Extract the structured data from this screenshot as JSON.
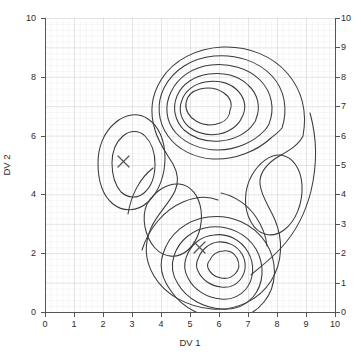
{
  "chart_data": {
    "type": "contour",
    "title": "",
    "xlabel": "DV 1",
    "ylabel": "DV 2",
    "xlim": [
      0,
      10
    ],
    "ylim": [
      0,
      10
    ],
    "grid": true,
    "grid_minor_step": 0.2,
    "grid_major_step": 1,
    "x_ticks": [
      0,
      1,
      2,
      3,
      4,
      5,
      6,
      7,
      8,
      9,
      10
    ],
    "x_tick_labels": [
      "0",
      "1",
      "2",
      "3",
      "4",
      "5",
      "6",
      "7",
      "8",
      "9",
      "10"
    ],
    "y_ticks_left": [
      0,
      2,
      4,
      6,
      8,
      10
    ],
    "y_tick_labels_left": [
      "0",
      "2",
      "4",
      "6",
      "8",
      "10"
    ],
    "y_ticks_right": [
      0,
      1,
      2,
      3,
      4,
      5,
      6,
      7,
      8,
      9,
      10
    ],
    "y_tick_labels_right": [
      "0",
      "1",
      "2",
      "3",
      "4",
      "5",
      "6",
      "7",
      "8",
      "9",
      "10"
    ],
    "line_color": "#3a3a3a",
    "grid_color": "#d8d8d8",
    "markers": [
      {
        "label": "X",
        "x": 2.7,
        "y": 5.3
      },
      {
        "label": "X",
        "x": 5.35,
        "y": 2.2
      }
    ],
    "peaks": [
      {
        "name": "upper-peak",
        "x": 5.0,
        "y": 7.6,
        "levels": 5
      },
      {
        "name": "lower-right-peak",
        "x": 5.35,
        "y": 2.2,
        "levels": 5
      },
      {
        "name": "left-peak",
        "x": 2.7,
        "y": 5.3,
        "levels": 2
      },
      {
        "name": "right-lobe",
        "x": 7.0,
        "y": 5.0,
        "levels": 1
      }
    ]
  },
  "axes": {
    "x_label": "DV 1",
    "y_label": "DV 2"
  }
}
